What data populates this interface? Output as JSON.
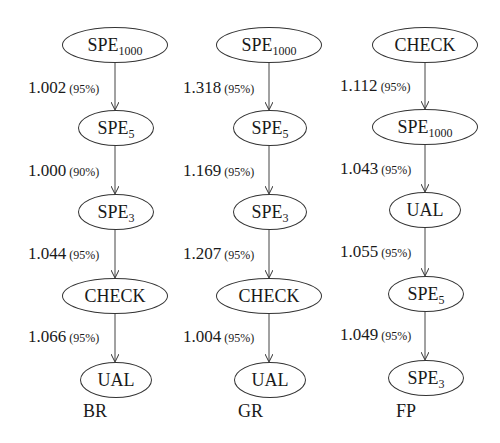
{
  "diagram": {
    "columns": [
      {
        "label": "BR",
        "nodes": [
          {
            "base": "SPE",
            "sub": "1000"
          },
          {
            "base": "SPE",
            "sub": "5"
          },
          {
            "base": "SPE",
            "sub": "3"
          },
          {
            "base": "CHECK",
            "sub": ""
          },
          {
            "base": "UAL",
            "sub": ""
          }
        ],
        "edges": [
          {
            "value": "1.002",
            "conf": "(95%)"
          },
          {
            "value": "1.000",
            "conf": "(90%)"
          },
          {
            "value": "1.044",
            "conf": "(95%)"
          },
          {
            "value": "1.066",
            "conf": "(95%)"
          }
        ]
      },
      {
        "label": "GR",
        "nodes": [
          {
            "base": "SPE",
            "sub": "1000"
          },
          {
            "base": "SPE",
            "sub": "5"
          },
          {
            "base": "SPE",
            "sub": "3"
          },
          {
            "base": "CHECK",
            "sub": ""
          },
          {
            "base": "UAL",
            "sub": ""
          }
        ],
        "edges": [
          {
            "value": "1.318",
            "conf": "(95%)"
          },
          {
            "value": "1.169",
            "conf": "(95%)"
          },
          {
            "value": "1.207",
            "conf": "(95%)"
          },
          {
            "value": "1.004",
            "conf": "(95%)"
          }
        ]
      },
      {
        "label": "FP",
        "nodes": [
          {
            "base": "CHECK",
            "sub": ""
          },
          {
            "base": "SPE",
            "sub": "1000"
          },
          {
            "base": "UAL",
            "sub": ""
          },
          {
            "base": "SPE",
            "sub": "5"
          },
          {
            "base": "SPE",
            "sub": "3"
          }
        ],
        "edges": [
          {
            "value": "1.112",
            "conf": "(95%)"
          },
          {
            "value": "1.043",
            "conf": "(95%)"
          },
          {
            "value": "1.055",
            "conf": "(95%)"
          },
          {
            "value": "1.049",
            "conf": "(95%)"
          }
        ]
      }
    ]
  }
}
